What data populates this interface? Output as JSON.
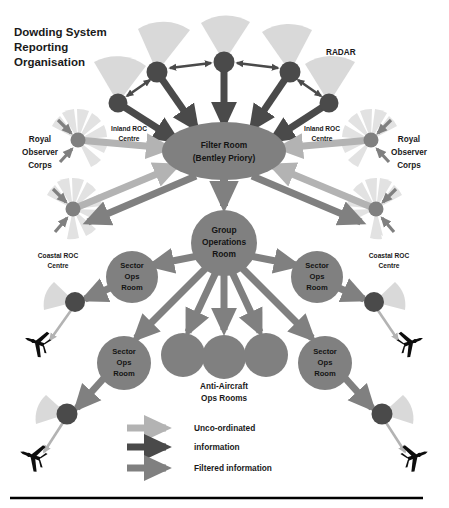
{
  "figure": {
    "title_lines": [
      "Dowding System",
      "Reporting",
      "Organisation"
    ],
    "background": "#ffffff",
    "bottom_rule_color": "#000000"
  },
  "colors": {
    "light_gray": "#b3b3b3",
    "medium_gray": "#808080",
    "dark_gray": "#4a4a4a",
    "node_dark": "#4a4a4a",
    "node_medium": "#808080",
    "fan_light": "#d9d9d9",
    "fan_dotted": "#e0e0e0",
    "aircraft": "#0d0d0d"
  },
  "labels": {
    "radar": "RADAR",
    "royal_observer_corps_left": [
      "Royal",
      "Observer",
      "Corps"
    ],
    "royal_observer_corps_right": [
      "Royal",
      "Observer",
      "Corps"
    ],
    "inland_roc_left": [
      "Inland ROC",
      "Centre"
    ],
    "inland_roc_right": [
      "Inland ROC",
      "Centre"
    ],
    "coastal_roc_left": [
      "Coastal ROC",
      "Centre"
    ],
    "coastal_roc_right": [
      "Coastal ROC",
      "Centre"
    ],
    "anti_aircraft": [
      "Anti-Aircraft",
      "Ops Rooms"
    ]
  },
  "nodes": {
    "filter_room": {
      "lines": [
        "Filter Room",
        "(Bentley Priory)"
      ],
      "shape": "ellipse",
      "color": "#808080"
    },
    "group_ops": {
      "lines": [
        "Group",
        "Operations",
        "Room"
      ],
      "shape": "circle",
      "color": "#808080"
    },
    "sector_ops": [
      {
        "lines": [
          "Sector",
          "Ops",
          "Room"
        ],
        "color": "#808080"
      },
      {
        "lines": [
          "Sector",
          "Ops",
          "Room"
        ],
        "color": "#808080"
      },
      {
        "lines": [
          "Sector",
          "Ops",
          "Room"
        ],
        "color": "#808080"
      },
      {
        "lines": [
          "Sector",
          "Ops",
          "Room"
        ],
        "color": "#808080"
      }
    ],
    "anti_aircraft_rooms": [
      {
        "label": "",
        "color": "#808080"
      },
      {
        "label": "",
        "color": "#808080"
      },
      {
        "label": "",
        "color": "#808080"
      }
    ],
    "radar_stations_count": 5,
    "inland_roc_count": 2,
    "coastal_roc_count": 2,
    "airfield_count": 4,
    "aircraft_count": 4
  },
  "legend": {
    "items": [
      {
        "label": "Unco-ordinated",
        "color": "#b3b3b3",
        "arrow": "light-arrow"
      },
      {
        "label": "information",
        "color": "#4a4a4a",
        "arrow": "dark-arrow"
      },
      {
        "label": "Filtered information",
        "color": "#808080",
        "arrow": "medium-arrow"
      }
    ]
  }
}
